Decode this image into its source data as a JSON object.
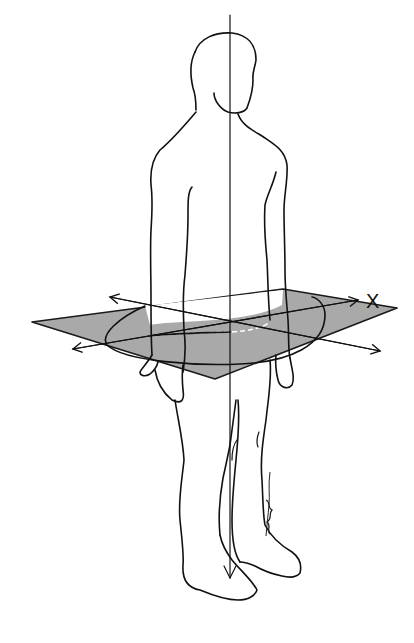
{
  "figure": {
    "plane_color": "#a9a9a9",
    "line_color": "#111111",
    "background": "#ffffff",
    "axis_label": "X",
    "vertical_axis": {
      "x": 230,
      "y_top": 15,
      "y_bottom": 580
    },
    "plane_vertices": [
      [
        32,
        322
      ],
      [
        283,
        289
      ],
      [
        397,
        308
      ],
      [
        215,
        379
      ]
    ],
    "horizontal_axes": [
      {
        "from": [
          110,
          297
        ],
        "to": [
          380,
          351
        ]
      },
      {
        "from": [
          73,
          349
        ],
        "to": [
          358,
          300
        ]
      }
    ],
    "signature": "artist signature (illegible)"
  }
}
